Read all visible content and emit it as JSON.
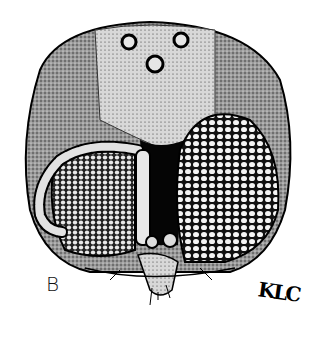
{
  "figure": {
    "panel_label": "B",
    "signature": "KLC",
    "colors": {
      "background": "#ffffff",
      "ink": "#000000",
      "stipple_mid": "#6e6e6e"
    }
  }
}
